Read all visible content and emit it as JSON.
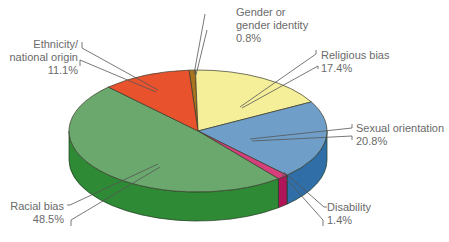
{
  "chart_data": {
    "type": "pie",
    "style": "3d-exploded-none",
    "title": "",
    "slices": [
      {
        "label": "Racial bias",
        "value": 48.5,
        "color": "#6aa86e",
        "side_color": "#2f8a36"
      },
      {
        "label": "Sexual orientation",
        "value": 20.8,
        "color": "#6f9fc9",
        "side_color": "#2f6ea6"
      },
      {
        "label": "Religious bias",
        "value": 17.4,
        "color": "#f6ef9a",
        "side_color": "#d9cf6a"
      },
      {
        "label": "Ethnicity/ national origin",
        "value": 11.1,
        "color": "#e8532e",
        "side_color": "#b83a1e"
      },
      {
        "label": "Disability",
        "value": 1.4,
        "color": "#d63f7c",
        "side_color": "#b0155a"
      },
      {
        "label": "Gender or gender identity",
        "value": 0.8,
        "color": "#a8741e",
        "side_color": "#7d5412"
      }
    ],
    "legend": "none (callout labels)"
  },
  "labels": {
    "gender": {
      "line1": "Gender or",
      "line2": "gender identity",
      "pct": "0.8%"
    },
    "ethnicity": {
      "line1": "Ethnicity/",
      "line2": "national origin",
      "pct": "11.1%"
    },
    "religious": {
      "line1": "Religious bias",
      "pct": "17.4%"
    },
    "sexual": {
      "line1": "Sexual orientation",
      "pct": "20.8%"
    },
    "disability": {
      "line1": "Disability",
      "pct": "1.4%"
    },
    "racial": {
      "line1": "Racial bias",
      "pct": "48.5%"
    }
  }
}
